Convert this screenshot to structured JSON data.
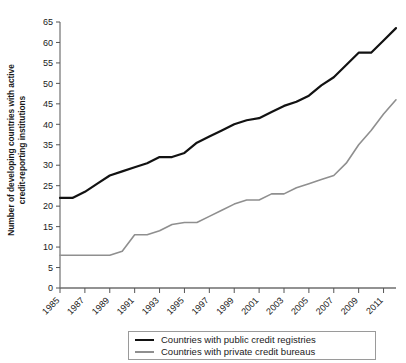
{
  "chart_data": {
    "type": "line",
    "title": "",
    "xlabel": "",
    "ylabel": "Number of developing countries with active credit-reporting institutions",
    "ylabel_line1": "Number of developing countries with active",
    "ylabel_line2": "credit-reporting institutions",
    "ylim": [
      0,
      65
    ],
    "ytick_step": 5,
    "yticks": [
      0,
      5,
      10,
      15,
      20,
      25,
      30,
      35,
      40,
      45,
      50,
      55,
      60,
      65
    ],
    "xlim": [
      1985,
      2012
    ],
    "xticks": [
      1985,
      1987,
      1989,
      1991,
      1993,
      1995,
      1997,
      1999,
      2001,
      2003,
      2005,
      2007,
      2009,
      2011
    ],
    "xtick_labels": [
      "1985",
      "1987",
      "1989",
      "1991",
      "1993",
      "1995",
      "1997",
      "1999",
      "2001",
      "2003",
      "2005",
      "2007",
      "2009",
      "2011"
    ],
    "grid": false,
    "legend_position": "bottom",
    "x": [
      1985,
      1986,
      1987,
      1988,
      1989,
      1990,
      1991,
      1992,
      1993,
      1994,
      1995,
      1996,
      1997,
      1998,
      1999,
      2000,
      2001,
      2002,
      2003,
      2004,
      2005,
      2006,
      2007,
      2008,
      2009,
      2010,
      2011,
      2012
    ],
    "series": [
      {
        "name": "Countries with public credit registries",
        "color": "#121212",
        "values": [
          22,
          22,
          23.5,
          25.5,
          27.5,
          28.5,
          29.5,
          30.5,
          32,
          32,
          33,
          35.5,
          37,
          38.5,
          40,
          41,
          41.5,
          43,
          44.5,
          45.5,
          47,
          49.5,
          51.5,
          54.5,
          57.5,
          57.5,
          60.5,
          63.5
        ]
      },
      {
        "name": "Countries with private credit bureaus",
        "color": "#8f8f8f",
        "values": [
          8,
          8,
          8,
          8,
          8,
          9,
          13,
          13,
          14,
          15.5,
          16,
          16,
          17.5,
          19,
          20.5,
          21.5,
          21.5,
          23,
          23,
          24.5,
          25.5,
          26.5,
          27.5,
          30.5,
          35,
          38.5,
          42.5,
          46
        ]
      }
    ],
    "series_tail": {
      "note": "values continue to 2011 end points",
      "public_end": 64.5,
      "private_end": 47.5
    }
  },
  "legend": {
    "items": [
      {
        "label": "Countries with public credit registries",
        "swatch": "public"
      },
      {
        "label": "Countries with private credit bureaus",
        "swatch": "private"
      }
    ]
  }
}
